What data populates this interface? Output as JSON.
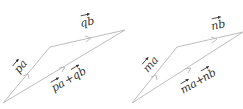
{
  "diagrams": [
    {
      "name": "left",
      "labels": {
        "side1": "pa",
        "side2": "qb",
        "sum_a": "pa",
        "plus": "+",
        "sum_b": "qb"
      },
      "vertices": {
        "origin": [
          3,
          103
        ],
        "mid": [
          50,
          47
        ],
        "tip": [
          125,
          30
        ]
      }
    },
    {
      "name": "right",
      "labels": {
        "side1": "ma",
        "side2": "nb",
        "sum_a": "ma",
        "plus": "+",
        "sum_b": "nb"
      },
      "vertices": {
        "origin": [
          132,
          103
        ],
        "mid": [
          177,
          47
        ],
        "tip": [
          243,
          32
        ]
      }
    }
  ],
  "colors": {
    "line": "#bdbdbd",
    "text": "#333333"
  }
}
